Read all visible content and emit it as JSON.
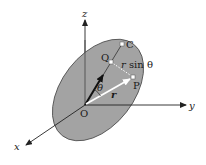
{
  "diagram": {
    "type": "3d-vector-geometry",
    "colors": {
      "plane_fill": "#a3a3a3",
      "plane_stroke": "#4a4a4a",
      "axis": "#222222",
      "vector_dark": "#111111",
      "vector_light": "#ffffff",
      "point_fill": "#ffffff",
      "dotted": "#ffffff"
    },
    "axes": {
      "x_label": "x",
      "y_label": "y",
      "z_label": "z",
      "origin_label": "O"
    },
    "points": [
      {
        "label": "C",
        "x": 122,
        "y": 44
      },
      {
        "label": "Q",
        "x": 111,
        "y": 62
      },
      {
        "label": "P",
        "x": 133,
        "y": 77
      }
    ],
    "labels": {
      "theta": "θ",
      "r": "r",
      "r_sin_theta_r": "r",
      "r_sin_theta_rest": " sin θ"
    }
  }
}
